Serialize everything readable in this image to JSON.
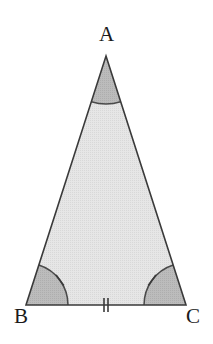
{
  "figure": {
    "kind": "isosceles-triangle-diagram",
    "canvas": {
      "width": 213,
      "height": 344,
      "background": "#ffffff"
    },
    "labels": {
      "apex": "A",
      "bottom_left": "B",
      "bottom_right": "C"
    },
    "vertices": {
      "A": {
        "x": 106,
        "y": 56
      },
      "B": {
        "x": 26,
        "y": 305
      },
      "C": {
        "x": 186,
        "y": 305
      }
    },
    "colors": {
      "interior_fill": "#e3e3e3",
      "angle_sector_fill": "#b8b8b8",
      "outline": "#3a3a3a",
      "arc_stroke": "#4a4a4a",
      "tick_stroke": "#3a3a3a",
      "label_color": "#1b1b1b"
    },
    "strokes": {
      "outline_width": 1.6,
      "arc_width": 1.5,
      "tick_width": 1.6
    },
    "angle_marks": [
      {
        "vertex": "A",
        "radius": 48,
        "tick_count": 0
      },
      {
        "vertex": "B",
        "radius": 42,
        "tick_count": 1
      },
      {
        "vertex": "C",
        "radius": 42,
        "tick_count": 1
      }
    ],
    "side_marks": [
      {
        "side": "BC",
        "tick_count": 2,
        "center_x": 106,
        "center_y": 305,
        "tick_half_height": 7,
        "tick_gap": 4
      }
    ]
  }
}
